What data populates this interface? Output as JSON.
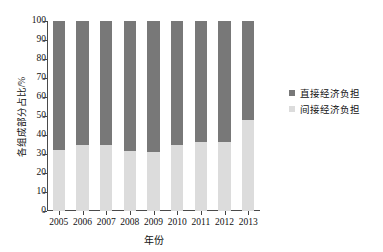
{
  "chart_data": {
    "type": "bar",
    "subtype": "stacked-100-percent",
    "title": "",
    "xlabel": "年份",
    "ylabel": "各组成部分占比/%",
    "categories": [
      "2005",
      "2006",
      "2007",
      "2008",
      "2009",
      "2010",
      "2011",
      "2012",
      "2013"
    ],
    "series": [
      {
        "name": "间接经济负担",
        "color": "#dcdcdc",
        "values": [
          32,
          35,
          35,
          31.5,
          31,
          35,
          36.5,
          36.5,
          48
        ]
      },
      {
        "name": "直接经济负担",
        "color": "#787878",
        "values": [
          68,
          65,
          65,
          68.5,
          69,
          65,
          63.5,
          63.5,
          52
        ]
      }
    ],
    "ylim": [
      0,
      100
    ],
    "y_ticks": [
      0,
      10,
      20,
      30,
      40,
      50,
      60,
      70,
      80,
      90,
      100
    ],
    "y_ticklabels": [
      "0",
      "10",
      "20",
      "30",
      "40",
      "50",
      "60",
      "70",
      "80",
      "90",
      "100"
    ],
    "grid": false,
    "legend_position": "right"
  },
  "axes": {
    "y_title": "各组成部分占比/%",
    "x_title": "年份"
  },
  "legend": {
    "entries": [
      {
        "label": "直接经济负担",
        "color": "#787878"
      },
      {
        "label": "间接经济负担",
        "color": "#dcdcdc"
      }
    ]
  }
}
